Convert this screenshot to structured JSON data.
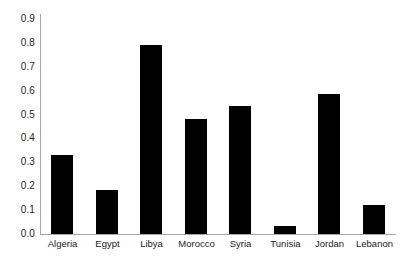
{
  "chart_data": {
    "type": "bar",
    "title": "",
    "xlabel": "",
    "ylabel": "",
    "categories": [
      "Algeria",
      "Egypt",
      "Libya",
      "Morocco",
      "Syria",
      "Tunisia",
      "Jordan",
      "Lebanon"
    ],
    "values": [
      0.33,
      0.185,
      0.79,
      0.48,
      0.535,
      0.035,
      0.585,
      0.12
    ],
    "ylim": [
      0.0,
      0.9
    ],
    "ytick_labels": [
      "0.0",
      "0.1",
      "0.2",
      "0.3",
      "0.4",
      "0.5",
      "0.6",
      "0.7",
      "0.8",
      "0.9"
    ],
    "ytick_values": [
      0.0,
      0.1,
      0.2,
      0.3,
      0.4,
      0.5,
      0.6,
      0.7,
      0.8,
      0.9
    ],
    "grid": false,
    "legend": null,
    "bar_color": "#000000",
    "axis_color": "#a6a6a6",
    "text_color": "#262626",
    "background": "#ffffff"
  }
}
